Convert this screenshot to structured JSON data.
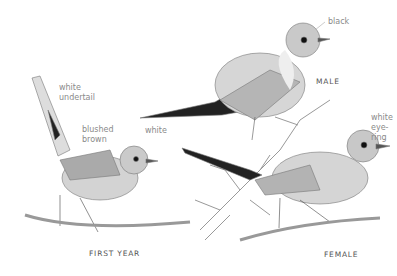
{
  "labels": {
    "white_undertail_1": "white",
    "white_undertail_2": "undertail",
    "blushed_1": "blushed",
    "blushed_2": "brown",
    "white": "white",
    "black": "black",
    "eyering_1": "white",
    "eyering_2": "eye-ring"
  },
  "captions": {
    "male": "MALE",
    "first_year": "FIRST YEAR",
    "female": "FEMALE"
  }
}
